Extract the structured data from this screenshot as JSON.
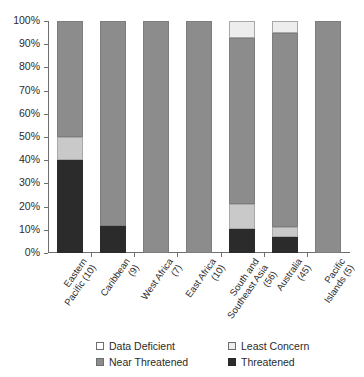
{
  "chart_data": {
    "type": "bar",
    "stacked": true,
    "stack_mode": "percent",
    "title": "",
    "subtitle": "",
    "xlabel": "",
    "ylabel": "",
    "ylim": [
      0,
      100
    ],
    "ytick_labels": [
      "0%",
      "10%",
      "20%",
      "30%",
      "40%",
      "50%",
      "60%",
      "70%",
      "80%",
      "90%",
      "100%"
    ],
    "ytick_values": [
      0,
      10,
      20,
      30,
      40,
      50,
      60,
      70,
      80,
      90,
      100
    ],
    "grid": false,
    "legend_position": "bottom",
    "categories": [
      "Eastern\nPacific (10)",
      "Caribbean\n(9)",
      "West Africa\n(7)",
      "East Africa\n(10)",
      "South and\nSoutheast Asia\n(56)",
      "Australia\n(45)",
      "Pacific\nIslands (5)"
    ],
    "series": [
      {
        "name": "Threatened",
        "color": "#2b2b2b",
        "values": [
          40,
          11.5,
          0,
          0,
          10.5,
          6.7,
          0
        ]
      },
      {
        "name": "Data Deficient",
        "color": "#c9c9c9",
        "values": [
          10,
          0,
          0,
          0,
          10.5,
          4.4,
          0
        ]
      },
      {
        "name": "Near Threatened",
        "color": "#8c8c8c",
        "values": [
          50,
          88.5,
          100,
          100,
          71.5,
          83.9,
          100
        ]
      },
      {
        "name": "Least Concern",
        "color": "#ededed",
        "values": [
          0,
          0,
          0,
          0,
          7.5,
          5.0,
          0
        ]
      }
    ],
    "legend_entries": [
      {
        "label": "Data Deficient",
        "color": "#ffffff",
        "swatch": "s-deficient"
      },
      {
        "label": "Least Concern",
        "color": "#ededed",
        "swatch": "s-least"
      },
      {
        "label": "Near Threatened",
        "color": "#8c8c8c",
        "swatch": "s-near"
      },
      {
        "label": "Threatened",
        "color": "#2b2b2b",
        "swatch": "s-threatened"
      }
    ],
    "axis_color": "#6e6e6e"
  }
}
